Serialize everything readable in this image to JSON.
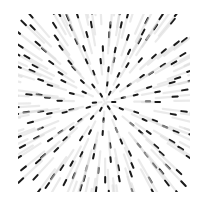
{
  "image": {
    "description": "Radial particle burst: dark dots with motion-blur streaks pointing outward from center, clipped to a square",
    "width": 207,
    "height": 204,
    "background": "#ffffff",
    "center": [
      105,
      102
    ],
    "clip": {
      "x": 18,
      "y": 14,
      "w": 172,
      "h": 178
    },
    "dot_color": "#1a1a1a",
    "streak_color": "#d8d8d8",
    "rings": [
      {
        "r": 10,
        "count": 6
      },
      {
        "r": 22,
        "count": 10
      },
      {
        "r": 34,
        "count": 14
      },
      {
        "r": 46,
        "count": 18
      },
      {
        "r": 58,
        "count": 22
      },
      {
        "r": 70,
        "count": 26
      },
      {
        "r": 82,
        "count": 30
      },
      {
        "r": 94,
        "count": 34
      },
      {
        "r": 106,
        "count": 38
      },
      {
        "r": 118,
        "count": 42
      }
    ]
  }
}
